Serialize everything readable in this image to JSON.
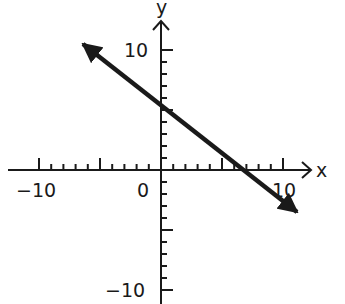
{
  "chart_data": {
    "type": "line",
    "title": "",
    "xlabel": "x",
    "ylabel": "y",
    "xlim": [
      -10,
      10
    ],
    "ylim": [
      -10,
      10
    ],
    "x_tick_labels": [
      "-10",
      "0",
      "10"
    ],
    "y_tick_labels": [
      "10",
      "-10"
    ],
    "grid": false,
    "series": [
      {
        "name": "line",
        "equation": "y = -0.75x + 5",
        "slope": -0.75,
        "y_intercept": 5,
        "x_intercept": 6.67,
        "x": [
          -6.6,
          0,
          6.67,
          11.3
        ],
        "y": [
          10.0,
          5,
          0,
          -3.5
        ],
        "arrows_both_ends": true
      }
    ]
  },
  "labels": {
    "x_axis": "x",
    "y_axis": "y",
    "x_neg10": "−10",
    "origin": "0",
    "x_pos10": "10",
    "y_pos10": "10",
    "y_neg10": "−10"
  },
  "colors": {
    "ink": "#1a1a1a",
    "background": "#ffffff"
  }
}
